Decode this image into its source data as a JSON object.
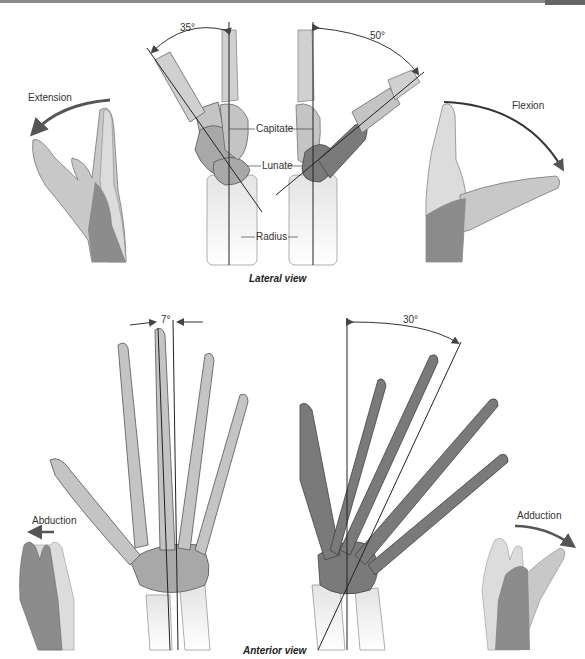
{
  "figure": {
    "lateral_view": {
      "caption": "Lateral view",
      "extension": {
        "label": "Extension",
        "angle": "35°"
      },
      "flexion": {
        "label": "Flexion",
        "angle": "50°"
      },
      "bone_labels": [
        "Capitate",
        "Lunate",
        "Radius"
      ]
    },
    "anterior_view": {
      "caption": "Anterior view",
      "abduction": {
        "label": "Abduction",
        "angle": "7°"
      },
      "adduction": {
        "label": "Adduction",
        "angle": "30°"
      }
    },
    "colors": {
      "bone_light": "#c4c4c4",
      "bone_dark": "#7a7a7a",
      "bone_outline": "#555555",
      "hand_light": "#c8c8c8",
      "hand_mid": "#a8a8a8",
      "hand_dark": "#8c8c8c",
      "forearm_bone": "#e6e6e6",
      "axis_line": "#222222",
      "arrow": "#555555"
    }
  }
}
